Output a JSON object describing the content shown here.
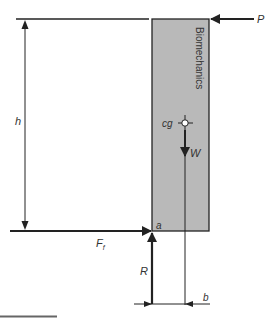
{
  "diagram": {
    "title_text": "Biomechanics",
    "labels": {
      "push_force": "P",
      "height": "h",
      "center_of_gravity": "cg",
      "weight": "W",
      "pivot_point": "a",
      "friction_force": "F",
      "friction_subscript": "f",
      "reaction_force": "R",
      "moment_arm": "b"
    },
    "colors": {
      "block_fill": "#b9b9b9",
      "line": "#222222",
      "text": "#333333",
      "bottom_rule": "#666666"
    }
  }
}
